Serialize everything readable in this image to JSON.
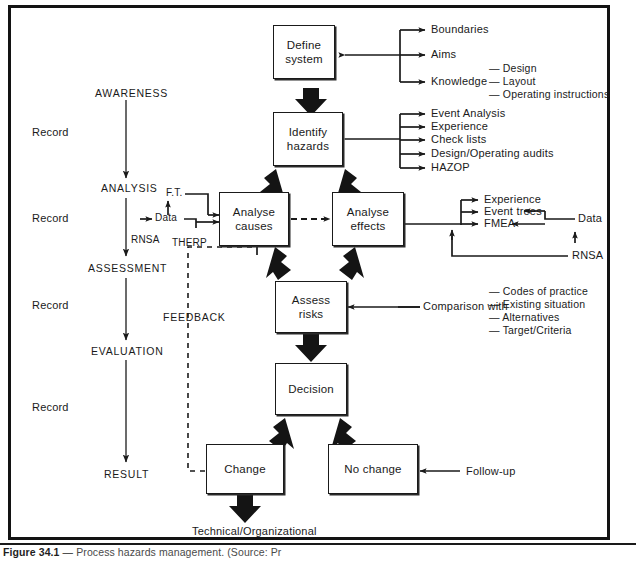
{
  "figure": {
    "caption_label": "Figure 34.1",
    "caption_dash": "—",
    "caption_text": "Process hazards management. (Source: Pr"
  },
  "nodes": {
    "define_system": "Define\nsystem",
    "identify_hazards": "Identify\nhazards",
    "analyse_causes": "Analyse\ncauses",
    "analyse_effects": "Analyse\neffects",
    "assess_risks": "Assess\nrisks",
    "decision": "Decision",
    "change": "Change",
    "no_change": "No change"
  },
  "left_column": {
    "awareness": "AWARENESS",
    "analysis": "ANALYSIS",
    "assessment": "ASSESSMENT",
    "evaluation": "EVALUATION",
    "result": "RESULT",
    "record_1": "Record",
    "record_2": "Record",
    "record_3": "Record",
    "record_4": "Record"
  },
  "define_system_inputs": {
    "boundaries": "Boundaries",
    "aims": "Aims",
    "knowledge": "Knowledge",
    "knowledge_sub": [
      "— Design",
      "— Layout",
      "— Operating instructions"
    ]
  },
  "identify_hazards_inputs": [
    "Event Analysis",
    "Experience",
    "Check lists",
    "Design/Operating audits",
    "HAZOP"
  ],
  "analyse_causes_inputs": {
    "ft": "F.T.",
    "data": "Data",
    "therp": "THERP",
    "rnsa": "RNSA"
  },
  "analyse_effects_inputs": {
    "experience": "Experience",
    "event_trees": "Event trees",
    "fmea": "FMEA",
    "data": "Data",
    "rnsa": "RNSA"
  },
  "assess_risks_inputs": {
    "comparison_with": "Comparison with",
    "items": [
      "— Codes of practice",
      "— Existing situation",
      "— Alternatives",
      "— Target/Criteria"
    ]
  },
  "feedback_label": "FEEDBACK",
  "follow_up_label": "Follow-up",
  "outcome_label": "Technical/Organizational",
  "colors": {
    "ink": "#1a1a1a",
    "frame": "#131313",
    "paper": "#ffffff"
  }
}
